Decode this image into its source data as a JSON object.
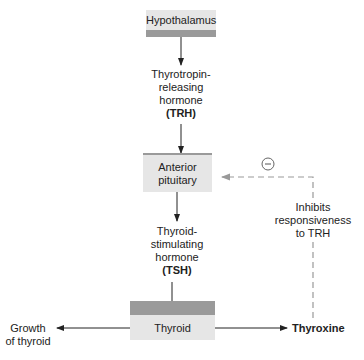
{
  "nodes": {
    "hypothalamus": "Hypothalamus",
    "anterior_pituitary": [
      "Anterior",
      "pituitary"
    ],
    "thyroid": "Thyroid",
    "thyroxine": "Thyroxine",
    "growth": [
      "Growth",
      "of thyroid"
    ]
  },
  "labels": {
    "trh": [
      "Thyrotropin-",
      "releasing",
      "hormone",
      "(TRH)"
    ],
    "tsh": [
      "Thyroid-",
      "stimulating",
      "hormone",
      "(TSH)"
    ],
    "inhibit": [
      "Inhibits",
      "responsiveness",
      "to TRH"
    ],
    "minus_sign": "−"
  },
  "colors": {
    "box": "#e6e6e6",
    "band": "#9a9a9a",
    "dashed": "#999999",
    "arrow": "#222222"
  }
}
